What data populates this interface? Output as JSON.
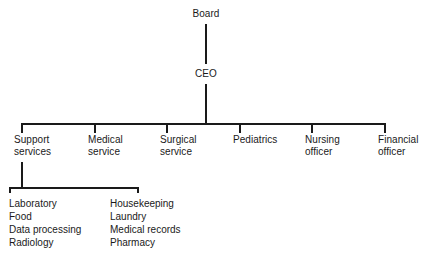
{
  "chart": {
    "type": "org-chart",
    "line_color": "#1a1a1a",
    "text_color": "#1a1a1a",
    "background": "#ffffff",
    "root": {
      "label": "Board"
    },
    "executive": {
      "label": "CEO"
    },
    "divisions": [
      {
        "label": "Support\nservices"
      },
      {
        "label": "Medical\nservice"
      },
      {
        "label": "Surgical\nservice"
      },
      {
        "label": "Pediatrics"
      },
      {
        "label": "Nursing\nofficer"
      },
      {
        "label": "Financial\nofficer"
      }
    ],
    "support_services_units": {
      "parent": "Support services",
      "column_left": "Laboratory\nFood\nData processing\nRadiology",
      "column_right": "Housekeeping\nLaundry\nMedical records\nPharmacy",
      "items_left": [
        "Laboratory",
        "Food",
        "Data processing",
        "Radiology"
      ],
      "items_right": [
        "Housekeeping",
        "Laundry",
        "Medical records",
        "Pharmacy"
      ]
    }
  }
}
